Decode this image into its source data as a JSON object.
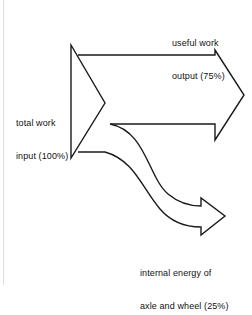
{
  "diagram": {
    "type": "energy-flow-sankey",
    "background_color": "#ffffff",
    "stroke_color": "#1a1a1a",
    "fill_color": "#ffffff",
    "stroke_width": 1.4,
    "labels": {
      "input": {
        "name": "total-work-input",
        "line1": "total work",
        "line2": "input (100%)",
        "percent": "100%",
        "value": 100
      },
      "output": {
        "name": "useful-work-output",
        "line1": "useful work",
        "line2": "output (75%)",
        "percent": "75%",
        "value": 75
      },
      "internal": {
        "name": "internal-energy-axle-wheel",
        "line1": "internal energy of",
        "line2": "axle and wheel (25%)",
        "percent": "25%",
        "value": 25
      }
    },
    "flows": [
      {
        "from": "total work input (100%)",
        "to": "useful work output (75%)",
        "value": 75
      },
      {
        "from": "total work input (100%)",
        "to": "internal energy of axle and wheel (25%)",
        "value": 25
      }
    ],
    "geometry": {
      "input_arrow": "M71,45 L71,158 L105,103 Z",
      "upper_band_top_y": 55,
      "upper_band_bottom_y": 124,
      "output_arrow_tip_x": 244,
      "branch_arrow_tip_x": 225
    }
  }
}
